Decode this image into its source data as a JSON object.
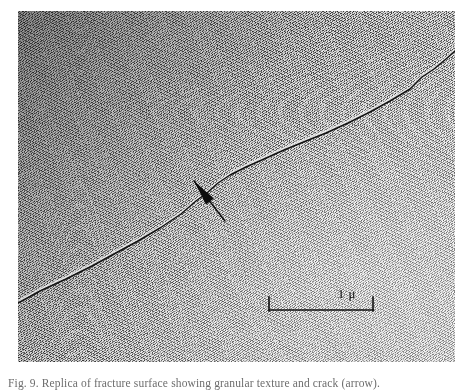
{
  "figure": {
    "type": "electron-micrograph",
    "background_color": "#ffffff",
    "plate": {
      "x": 18,
      "y": 11,
      "width": 437,
      "height": 351,
      "texture": "granular-speckle",
      "shading": "darker upper-left, lighter lower-right"
    }
  },
  "annotations": {
    "crack": {
      "name": "fracture-line",
      "color": "#121212",
      "path_points": [
        [
          0,
          292
        ],
        [
          22,
          280
        ],
        [
          48,
          268
        ],
        [
          74,
          255
        ],
        [
          96,
          243
        ],
        [
          120,
          230
        ],
        [
          142,
          217
        ],
        [
          163,
          203
        ],
        [
          178,
          190
        ],
        [
          190,
          181
        ],
        [
          200,
          172
        ],
        [
          212,
          164
        ],
        [
          228,
          156
        ],
        [
          246,
          148
        ],
        [
          266,
          139
        ],
        [
          288,
          130
        ],
        [
          308,
          122
        ],
        [
          330,
          112
        ],
        [
          352,
          101
        ],
        [
          372,
          90
        ],
        [
          392,
          78
        ],
        [
          404,
          66
        ],
        [
          416,
          58
        ],
        [
          428,
          48
        ],
        [
          437,
          40
        ]
      ]
    },
    "arrow": {
      "name": "pointer-arrow",
      "tip_x": 176,
      "tip_y": 170,
      "tail_x": 207,
      "tail_y": 210,
      "color": "#0d0d0d"
    }
  },
  "scale_bar": {
    "label": "1 μ",
    "value": 1,
    "unit": "μ",
    "color": "#111111",
    "left_px": 232,
    "top_px": 278,
    "length_px": 106,
    "tick_height_px": 14
  },
  "caption": {
    "text": "Fig. 9. Replica of fracture surface showing granular texture and crack (arrow).",
    "clipped": true
  }
}
